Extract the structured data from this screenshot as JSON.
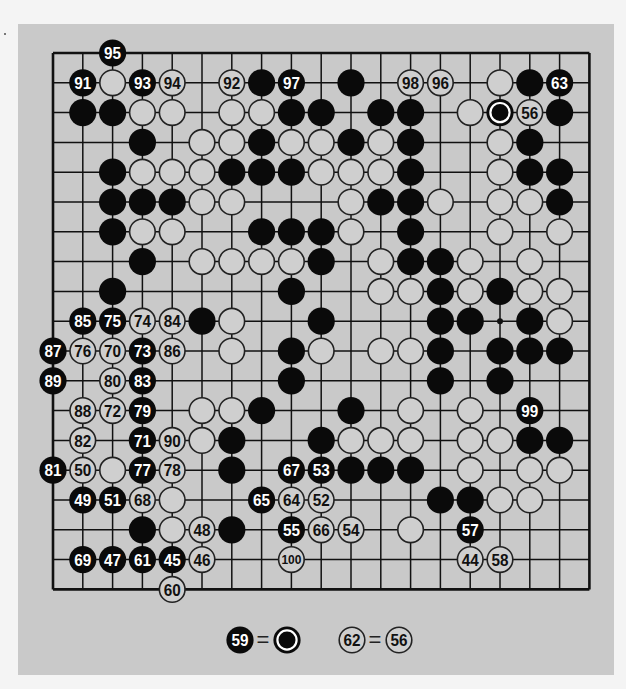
{
  "figure": {
    "type": "go-game-record",
    "board_size": 19,
    "colors": {
      "page_bg": "#f4f4f4",
      "figure_bg": "#c9c9c9",
      "line": "#111111",
      "black_stone": "#0a0a0a",
      "white_stone_fill": "#cfcfcf",
      "white_stone_stroke": "#222222",
      "black_label": "#ffffff",
      "white_label": "#111111"
    },
    "star_points": [
      [
        15,
        9
      ]
    ],
    "stones": [
      {
        "r": 0,
        "c": 2,
        "color": "B",
        "label": "95"
      },
      {
        "r": 1,
        "c": 1,
        "color": "B",
        "label": "91"
      },
      {
        "r": 1,
        "c": 2,
        "color": "W"
      },
      {
        "r": 1,
        "c": 3,
        "color": "B",
        "label": "93"
      },
      {
        "r": 1,
        "c": 4,
        "color": "W",
        "label": "94"
      },
      {
        "r": 1,
        "c": 6,
        "color": "W",
        "label": "92"
      },
      {
        "r": 1,
        "c": 7,
        "color": "B"
      },
      {
        "r": 1,
        "c": 8,
        "color": "B",
        "label": "97"
      },
      {
        "r": 1,
        "c": 10,
        "color": "B"
      },
      {
        "r": 1,
        "c": 12,
        "color": "W",
        "label": "98"
      },
      {
        "r": 1,
        "c": 13,
        "color": "W",
        "label": "96"
      },
      {
        "r": 1,
        "c": 15,
        "color": "W"
      },
      {
        "r": 1,
        "c": 16,
        "color": "B"
      },
      {
        "r": 1,
        "c": 17,
        "color": "B",
        "label": "63"
      },
      {
        "r": 2,
        "c": 1,
        "color": "B"
      },
      {
        "r": 2,
        "c": 2,
        "color": "B"
      },
      {
        "r": 2,
        "c": 3,
        "color": "W"
      },
      {
        "r": 2,
        "c": 4,
        "color": "W"
      },
      {
        "r": 2,
        "c": 6,
        "color": "W"
      },
      {
        "r": 2,
        "c": 7,
        "color": "W"
      },
      {
        "r": 2,
        "c": 8,
        "color": "B"
      },
      {
        "r": 2,
        "c": 9,
        "color": "B"
      },
      {
        "r": 2,
        "c": 11,
        "color": "B"
      },
      {
        "r": 2,
        "c": 12,
        "color": "B"
      },
      {
        "r": 2,
        "c": 14,
        "color": "W"
      },
      {
        "r": 2,
        "c": 15,
        "color": "B",
        "marker": "ring"
      },
      {
        "r": 2,
        "c": 16,
        "color": "W",
        "label": "56"
      },
      {
        "r": 2,
        "c": 17,
        "color": "B"
      },
      {
        "r": 3,
        "c": 3,
        "color": "B"
      },
      {
        "r": 3,
        "c": 5,
        "color": "W"
      },
      {
        "r": 3,
        "c": 6,
        "color": "W"
      },
      {
        "r": 3,
        "c": 7,
        "color": "B"
      },
      {
        "r": 3,
        "c": 8,
        "color": "W"
      },
      {
        "r": 3,
        "c": 9,
        "color": "W"
      },
      {
        "r": 3,
        "c": 10,
        "color": "B"
      },
      {
        "r": 3,
        "c": 11,
        "color": "W"
      },
      {
        "r": 3,
        "c": 12,
        "color": "B"
      },
      {
        "r": 3,
        "c": 15,
        "color": "W"
      },
      {
        "r": 3,
        "c": 16,
        "color": "B"
      },
      {
        "r": 4,
        "c": 2,
        "color": "B"
      },
      {
        "r": 4,
        "c": 3,
        "color": "W"
      },
      {
        "r": 4,
        "c": 4,
        "color": "W"
      },
      {
        "r": 4,
        "c": 5,
        "color": "W"
      },
      {
        "r": 4,
        "c": 6,
        "color": "B"
      },
      {
        "r": 4,
        "c": 7,
        "color": "B"
      },
      {
        "r": 4,
        "c": 8,
        "color": "B"
      },
      {
        "r": 4,
        "c": 9,
        "color": "W"
      },
      {
        "r": 4,
        "c": 10,
        "color": "W"
      },
      {
        "r": 4,
        "c": 11,
        "color": "W"
      },
      {
        "r": 4,
        "c": 12,
        "color": "B"
      },
      {
        "r": 4,
        "c": 15,
        "color": "W"
      },
      {
        "r": 4,
        "c": 16,
        "color": "B"
      },
      {
        "r": 4,
        "c": 17,
        "color": "B"
      },
      {
        "r": 5,
        "c": 2,
        "color": "B"
      },
      {
        "r": 5,
        "c": 3,
        "color": "B"
      },
      {
        "r": 5,
        "c": 4,
        "color": "B"
      },
      {
        "r": 5,
        "c": 5,
        "color": "W"
      },
      {
        "r": 5,
        "c": 6,
        "color": "W"
      },
      {
        "r": 5,
        "c": 10,
        "color": "W"
      },
      {
        "r": 5,
        "c": 11,
        "color": "B"
      },
      {
        "r": 5,
        "c": 12,
        "color": "B"
      },
      {
        "r": 5,
        "c": 13,
        "color": "W"
      },
      {
        "r": 5,
        "c": 15,
        "color": "W"
      },
      {
        "r": 5,
        "c": 16,
        "color": "W"
      },
      {
        "r": 5,
        "c": 17,
        "color": "B"
      },
      {
        "r": 6,
        "c": 2,
        "color": "B"
      },
      {
        "r": 6,
        "c": 3,
        "color": "W"
      },
      {
        "r": 6,
        "c": 4,
        "color": "W"
      },
      {
        "r": 6,
        "c": 7,
        "color": "B"
      },
      {
        "r": 6,
        "c": 8,
        "color": "B"
      },
      {
        "r": 6,
        "c": 9,
        "color": "B"
      },
      {
        "r": 6,
        "c": 10,
        "color": "W"
      },
      {
        "r": 6,
        "c": 12,
        "color": "B"
      },
      {
        "r": 6,
        "c": 15,
        "color": "W"
      },
      {
        "r": 6,
        "c": 17,
        "color": "W"
      },
      {
        "r": 7,
        "c": 3,
        "color": "B"
      },
      {
        "r": 7,
        "c": 5,
        "color": "W"
      },
      {
        "r": 7,
        "c": 6,
        "color": "W"
      },
      {
        "r": 7,
        "c": 7,
        "color": "W"
      },
      {
        "r": 7,
        "c": 8,
        "color": "W"
      },
      {
        "r": 7,
        "c": 9,
        "color": "B"
      },
      {
        "r": 7,
        "c": 11,
        "color": "W"
      },
      {
        "r": 7,
        "c": 12,
        "color": "B"
      },
      {
        "r": 7,
        "c": 13,
        "color": "B"
      },
      {
        "r": 7,
        "c": 14,
        "color": "W"
      },
      {
        "r": 7,
        "c": 16,
        "color": "W"
      },
      {
        "r": 8,
        "c": 2,
        "color": "B"
      },
      {
        "r": 8,
        "c": 8,
        "color": "B"
      },
      {
        "r": 8,
        "c": 11,
        "color": "W"
      },
      {
        "r": 8,
        "c": 12,
        "color": "W"
      },
      {
        "r": 8,
        "c": 13,
        "color": "B"
      },
      {
        "r": 8,
        "c": 14,
        "color": "W"
      },
      {
        "r": 8,
        "c": 15,
        "color": "B"
      },
      {
        "r": 8,
        "c": 16,
        "color": "W"
      },
      {
        "r": 8,
        "c": 17,
        "color": "W"
      },
      {
        "r": 9,
        "c": 1,
        "color": "B",
        "label": "85"
      },
      {
        "r": 9,
        "c": 2,
        "color": "B",
        "label": "75"
      },
      {
        "r": 9,
        "c": 3,
        "color": "W",
        "label": "74"
      },
      {
        "r": 9,
        "c": 4,
        "color": "W",
        "label": "84"
      },
      {
        "r": 9,
        "c": 5,
        "color": "B"
      },
      {
        "r": 9,
        "c": 6,
        "color": "W"
      },
      {
        "r": 9,
        "c": 9,
        "color": "B"
      },
      {
        "r": 9,
        "c": 13,
        "color": "B"
      },
      {
        "r": 9,
        "c": 14,
        "color": "B"
      },
      {
        "r": 9,
        "c": 16,
        "color": "B"
      },
      {
        "r": 9,
        "c": 17,
        "color": "W"
      },
      {
        "r": 10,
        "c": 0,
        "color": "B",
        "label": "87"
      },
      {
        "r": 10,
        "c": 1,
        "color": "W",
        "label": "76"
      },
      {
        "r": 10,
        "c": 2,
        "color": "W",
        "label": "70"
      },
      {
        "r": 10,
        "c": 3,
        "color": "B",
        "label": "73"
      },
      {
        "r": 10,
        "c": 4,
        "color": "W",
        "label": "86"
      },
      {
        "r": 10,
        "c": 6,
        "color": "W"
      },
      {
        "r": 10,
        "c": 8,
        "color": "B"
      },
      {
        "r": 10,
        "c": 9,
        "color": "W"
      },
      {
        "r": 10,
        "c": 11,
        "color": "W"
      },
      {
        "r": 10,
        "c": 12,
        "color": "W"
      },
      {
        "r": 10,
        "c": 13,
        "color": "B"
      },
      {
        "r": 10,
        "c": 15,
        "color": "B"
      },
      {
        "r": 10,
        "c": 16,
        "color": "B"
      },
      {
        "r": 10,
        "c": 17,
        "color": "B"
      },
      {
        "r": 11,
        "c": 0,
        "color": "B",
        "label": "89"
      },
      {
        "r": 11,
        "c": 2,
        "color": "W",
        "label": "80"
      },
      {
        "r": 11,
        "c": 3,
        "color": "B",
        "label": "83"
      },
      {
        "r": 11,
        "c": 8,
        "color": "B"
      },
      {
        "r": 11,
        "c": 13,
        "color": "B"
      },
      {
        "r": 11,
        "c": 15,
        "color": "B"
      },
      {
        "r": 12,
        "c": 1,
        "color": "W",
        "label": "88"
      },
      {
        "r": 12,
        "c": 2,
        "color": "W",
        "label": "72"
      },
      {
        "r": 12,
        "c": 3,
        "color": "B",
        "label": "79"
      },
      {
        "r": 12,
        "c": 5,
        "color": "W"
      },
      {
        "r": 12,
        "c": 6,
        "color": "W"
      },
      {
        "r": 12,
        "c": 7,
        "color": "B"
      },
      {
        "r": 12,
        "c": 10,
        "color": "B"
      },
      {
        "r": 12,
        "c": 12,
        "color": "W"
      },
      {
        "r": 12,
        "c": 14,
        "color": "W"
      },
      {
        "r": 12,
        "c": 16,
        "color": "B",
        "label": "99"
      },
      {
        "r": 13,
        "c": 1,
        "color": "W",
        "label": "82"
      },
      {
        "r": 13,
        "c": 3,
        "color": "B",
        "label": "71"
      },
      {
        "r": 13,
        "c": 4,
        "color": "W",
        "label": "90"
      },
      {
        "r": 13,
        "c": 5,
        "color": "W"
      },
      {
        "r": 13,
        "c": 6,
        "color": "B"
      },
      {
        "r": 13,
        "c": 9,
        "color": "B"
      },
      {
        "r": 13,
        "c": 10,
        "color": "W"
      },
      {
        "r": 13,
        "c": 11,
        "color": "W"
      },
      {
        "r": 13,
        "c": 12,
        "color": "W"
      },
      {
        "r": 13,
        "c": 14,
        "color": "W"
      },
      {
        "r": 13,
        "c": 15,
        "color": "W"
      },
      {
        "r": 13,
        "c": 16,
        "color": "B"
      },
      {
        "r": 13,
        "c": 17,
        "color": "B"
      },
      {
        "r": 14,
        "c": 0,
        "color": "B",
        "label": "81"
      },
      {
        "r": 14,
        "c": 1,
        "color": "W",
        "label": "50"
      },
      {
        "r": 14,
        "c": 2,
        "color": "W"
      },
      {
        "r": 14,
        "c": 3,
        "color": "B",
        "label": "77"
      },
      {
        "r": 14,
        "c": 4,
        "color": "W",
        "label": "78"
      },
      {
        "r": 14,
        "c": 6,
        "color": "B"
      },
      {
        "r": 14,
        "c": 8,
        "color": "B",
        "label": "67"
      },
      {
        "r": 14,
        "c": 9,
        "color": "B",
        "label": "53"
      },
      {
        "r": 14,
        "c": 10,
        "color": "B"
      },
      {
        "r": 14,
        "c": 11,
        "color": "B"
      },
      {
        "r": 14,
        "c": 12,
        "color": "B"
      },
      {
        "r": 14,
        "c": 14,
        "color": "W"
      },
      {
        "r": 14,
        "c": 16,
        "color": "W"
      },
      {
        "r": 14,
        "c": 17,
        "color": "W"
      },
      {
        "r": 15,
        "c": 1,
        "color": "B",
        "label": "49"
      },
      {
        "r": 15,
        "c": 2,
        "color": "B",
        "label": "51"
      },
      {
        "r": 15,
        "c": 3,
        "color": "W",
        "label": "68"
      },
      {
        "r": 15,
        "c": 4,
        "color": "W"
      },
      {
        "r": 15,
        "c": 7,
        "color": "B",
        "label": "65"
      },
      {
        "r": 15,
        "c": 8,
        "color": "W",
        "label": "64"
      },
      {
        "r": 15,
        "c": 9,
        "color": "W",
        "label": "52"
      },
      {
        "r": 15,
        "c": 13,
        "color": "B"
      },
      {
        "r": 15,
        "c": 14,
        "color": "B"
      },
      {
        "r": 15,
        "c": 15,
        "color": "W"
      },
      {
        "r": 15,
        "c": 16,
        "color": "W"
      },
      {
        "r": 16,
        "c": 3,
        "color": "B"
      },
      {
        "r": 16,
        "c": 4,
        "color": "W"
      },
      {
        "r": 16,
        "c": 5,
        "color": "W",
        "label": "48"
      },
      {
        "r": 16,
        "c": 6,
        "color": "B"
      },
      {
        "r": 16,
        "c": 8,
        "color": "B",
        "label": "55"
      },
      {
        "r": 16,
        "c": 9,
        "color": "W",
        "label": "66"
      },
      {
        "r": 16,
        "c": 10,
        "color": "W",
        "label": "54"
      },
      {
        "r": 16,
        "c": 12,
        "color": "W"
      },
      {
        "r": 16,
        "c": 14,
        "color": "B",
        "label": "57"
      },
      {
        "r": 17,
        "c": 1,
        "color": "B",
        "label": "69"
      },
      {
        "r": 17,
        "c": 2,
        "color": "B",
        "label": "47"
      },
      {
        "r": 17,
        "c": 3,
        "color": "B",
        "label": "61"
      },
      {
        "r": 17,
        "c": 4,
        "color": "B",
        "label": "45"
      },
      {
        "r": 17,
        "c": 5,
        "color": "W",
        "label": "46"
      },
      {
        "r": 17,
        "c": 8,
        "color": "W",
        "label": "100"
      },
      {
        "r": 17,
        "c": 14,
        "color": "W",
        "label": "44"
      },
      {
        "r": 17,
        "c": 15,
        "color": "W",
        "label": "58"
      },
      {
        "r": 18,
        "c": 4,
        "color": "W",
        "label": "60"
      }
    ],
    "legend": [
      {
        "stone": {
          "color": "B",
          "label": "59"
        },
        "equals": "=",
        "target": {
          "color": "B",
          "marker": "ring"
        }
      },
      {
        "stone": {
          "color": "W",
          "label": "62"
        },
        "equals": "=",
        "target": {
          "color": "W",
          "label": "56"
        }
      }
    ]
  }
}
